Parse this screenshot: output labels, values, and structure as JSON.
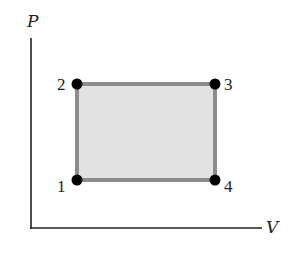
{
  "diagram": {
    "axes": {
      "y_label": "P",
      "x_label": "V",
      "origin": [
        31,
        228
      ],
      "y_top": 38,
      "x_right": 262
    },
    "cycle": {
      "fill_color": "#e2e2e2",
      "stroke_color": "#8c8c8c",
      "points": [
        {
          "id": "1",
          "label": "1",
          "x": 77,
          "y": 180,
          "label_dx": -20,
          "label_dy": 12
        },
        {
          "id": "2",
          "label": "2",
          "x": 77,
          "y": 84,
          "label_dx": -20,
          "label_dy": 6
        },
        {
          "id": "3",
          "label": "3",
          "x": 215,
          "y": 84,
          "label_dx": 9,
          "label_dy": 6
        },
        {
          "id": "4",
          "label": "4",
          "x": 215,
          "y": 180,
          "label_dx": 9,
          "label_dy": 12
        }
      ]
    },
    "colors": {
      "axis": "#222222",
      "point": "#000000"
    }
  }
}
